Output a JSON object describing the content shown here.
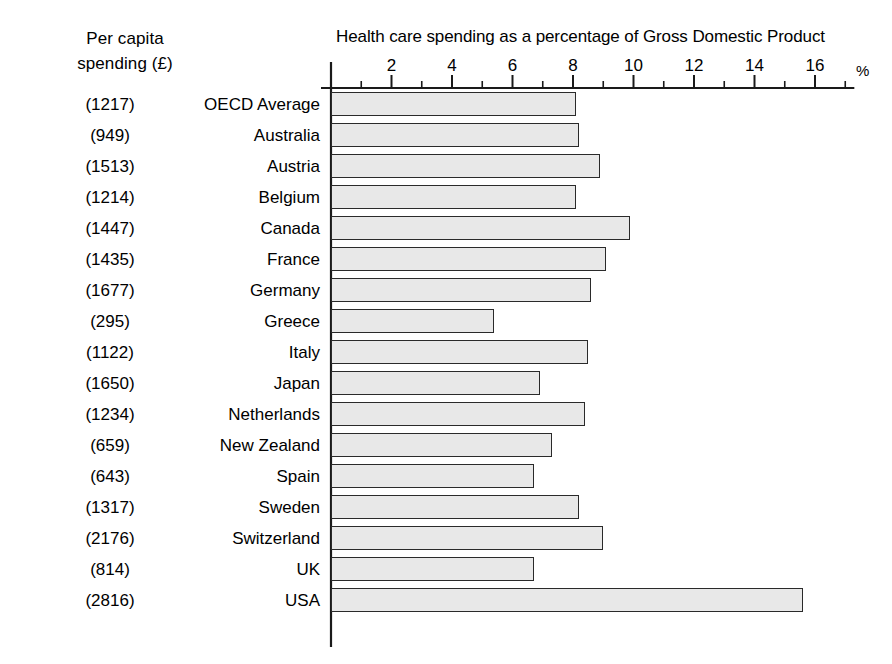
{
  "chart_data": {
    "type": "bar",
    "orientation": "horizontal",
    "title": "Health care spending as a percentage of Gross Domestic Product",
    "xlabel": "%",
    "ylabel": "",
    "xlim": [
      0,
      17.3
    ],
    "xticks": [
      2,
      4,
      6,
      8,
      10,
      12,
      14,
      16
    ],
    "xticks_minor_step": 1,
    "grid": false,
    "legend": false,
    "categories": [
      "OECD Average",
      "Australia",
      "Austria",
      "Belgium",
      "Canada",
      "France",
      "Germany",
      "Greece",
      "Italy",
      "Japan",
      "Netherlands",
      "New Zealand",
      "Spain",
      "Sweden",
      "Switzerland",
      "UK",
      "USA"
    ],
    "values": [
      8.1,
      8.2,
      8.9,
      8.1,
      9.9,
      9.1,
      8.6,
      5.4,
      8.5,
      6.9,
      8.4,
      7.3,
      6.7,
      8.2,
      9.0,
      6.7,
      15.6
    ],
    "secondary_series": {
      "name": "Per capita spending (£)",
      "labels": [
        "(1217)",
        "(949)",
        "(1513)",
        "(1214)",
        "(1447)",
        "(1435)",
        "(1677)",
        "(295)",
        "(1122)",
        "(1650)",
        "(1234)",
        "(659)",
        "(643)",
        "(1317)",
        "(2176)",
        "(814)",
        "(2816)"
      ],
      "values": [
        1217,
        949,
        1513,
        1214,
        1447,
        1435,
        1677,
        295,
        1122,
        1650,
        1234,
        659,
        643,
        1317,
        2176,
        814,
        2816
      ]
    },
    "bar_fill_color": "#e8e8e8",
    "bar_border_color": "#2a2a2a",
    "axis_color": "#1a1a1a"
  },
  "left_header": {
    "line1": "Per capita",
    "line2": "spending (£)"
  },
  "axis": {
    "tick_labels": [
      "2",
      "4",
      "6",
      "8",
      "10",
      "12",
      "14",
      "16"
    ],
    "unit_label": "%"
  }
}
